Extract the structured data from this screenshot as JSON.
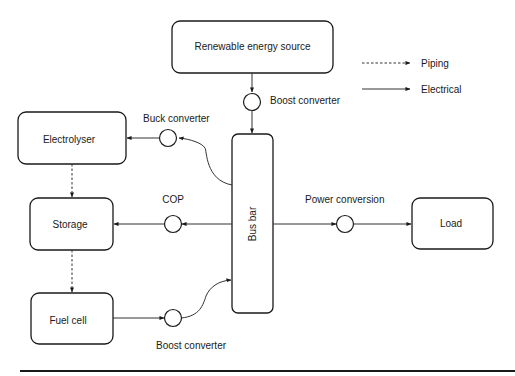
{
  "diagram": {
    "nodes": {
      "renewable": "Renewable energy source",
      "electrolyser": "Electrolyser",
      "storage": "Storage",
      "fuel_cell": "Fuel cell",
      "bus_bar": "Bus bar",
      "load": "Load"
    },
    "converters": {
      "boost_top": "Boost converter",
      "buck": "Buck converter",
      "cop": "COP",
      "boost_bottom": "Boost converter",
      "power_conversion": "Power conversion"
    },
    "legend": {
      "piping": "Piping",
      "electrical": "Electrical"
    },
    "connections": [
      {
        "from": "Renewable energy source",
        "to": "Bus bar",
        "via": "Boost converter",
        "type": "electrical"
      },
      {
        "from": "Bus bar",
        "to": "Electrolyser",
        "via": "Buck converter",
        "type": "electrical"
      },
      {
        "from": "Bus bar",
        "to": "Storage",
        "via": "COP",
        "type": "electrical"
      },
      {
        "from": "Fuel cell",
        "to": "Bus bar",
        "via": "Boost converter",
        "type": "electrical"
      },
      {
        "from": "Bus bar",
        "to": "Load",
        "via": "Power conversion",
        "type": "electrical"
      },
      {
        "from": "Electrolyser",
        "to": "Storage",
        "type": "piping"
      },
      {
        "from": "Storage",
        "to": "Fuel cell",
        "type": "piping"
      }
    ]
  }
}
